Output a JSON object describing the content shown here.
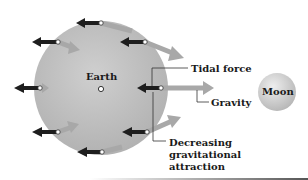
{
  "bodies": {
    "earth": {
      "label": "Earth",
      "color": "#b8b8b8"
    },
    "moon": {
      "label": "Moon",
      "color": "#c4c4c4"
    }
  },
  "labels": {
    "tidal_force": "Tidal force",
    "gravity": "Gravity",
    "decreasing_attraction": "Decreasing gravitational attraction"
  },
  "legend_colors": {
    "tidal_force_arrow": "#1e1e1e",
    "gravity_arrow": "#a8a8a8"
  },
  "arrow_points": [
    {
      "position": "top",
      "x": 101,
      "y": 23
    },
    {
      "position": "upper-left",
      "x": 58,
      "y": 42
    },
    {
      "position": "upper-right",
      "x": 145,
      "y": 42
    },
    {
      "position": "left",
      "x": 40,
      "y": 88
    },
    {
      "position": "center-right",
      "x": 161,
      "y": 88
    },
    {
      "position": "lower-left",
      "x": 58,
      "y": 132
    },
    {
      "position": "lower-right",
      "x": 147,
      "y": 132
    },
    {
      "position": "bottom",
      "x": 102,
      "y": 152
    }
  ]
}
